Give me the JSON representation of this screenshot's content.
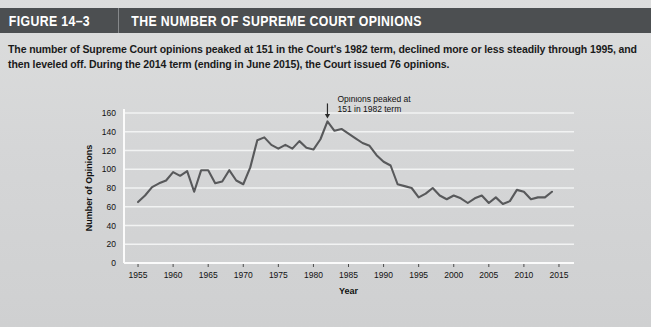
{
  "header": {
    "figure_number": "FIGURE 14–3",
    "title": "THE NUMBER OF SUPREME COURT OPINIONS",
    "bar_color": "#4c4f51",
    "text_color": "#ffffff"
  },
  "caption": "The number of Supreme Court opinions peaked at 151 in the Court's 1982 term, declined more or less steadily through 1995, and then leveled off. During the 2014 term (ending in June 2015), the Court issued 76 opinions.",
  "chart_data": {
    "type": "line",
    "title": "",
    "xlabel": "Year",
    "ylabel": "Number of Opinions",
    "xlim": [
      1953,
      2017
    ],
    "ylim": [
      0,
      160
    ],
    "xticks": [
      "1955",
      "1960",
      "1965",
      "1970",
      "1975",
      "1980",
      "1985",
      "1990",
      "1995",
      "2000",
      "2005",
      "2010",
      "2015"
    ],
    "yticks": [
      "0",
      "20",
      "40",
      "60",
      "80",
      "100",
      "120",
      "140",
      "160"
    ],
    "grid": true,
    "legend": null,
    "line_color": "#58595b",
    "grid_color": "#f2f3f3",
    "plot_background": "#d6d7d8",
    "annotations": [
      {
        "text_line1": "Opinions peaked at",
        "text_line2": "151 in 1982 term",
        "points_to_year": 1982,
        "points_to_value": 151,
        "marker": "down-arrow"
      }
    ],
    "x": [
      1955,
      1956,
      1957,
      1958,
      1959,
      1960,
      1961,
      1962,
      1963,
      1964,
      1965,
      1966,
      1967,
      1968,
      1969,
      1970,
      1971,
      1972,
      1973,
      1974,
      1975,
      1976,
      1977,
      1978,
      1979,
      1980,
      1981,
      1982,
      1983,
      1984,
      1985,
      1986,
      1987,
      1988,
      1989,
      1990,
      1991,
      1992,
      1993,
      1994,
      1995,
      1996,
      1997,
      1998,
      1999,
      2000,
      2001,
      2002,
      2003,
      2004,
      2005,
      2006,
      2007,
      2008,
      2009,
      2010,
      2011,
      2012,
      2013,
      2014
    ],
    "y": [
      65,
      72,
      81,
      85,
      88,
      97,
      93,
      98,
      76,
      99,
      99,
      85,
      87,
      99,
      88,
      84,
      102,
      131,
      134,
      126,
      122,
      126,
      122,
      130,
      123,
      121,
      132,
      151,
      141,
      143,
      138,
      133,
      128,
      125,
      115,
      108,
      104,
      84,
      82,
      80,
      70,
      74,
      80,
      72,
      68,
      72,
      69,
      64,
      69,
      72,
      64,
      70,
      63,
      66,
      78,
      76,
      68,
      70,
      70,
      76
    ],
    "series_name": "Supreme Court opinions"
  },
  "page_background": "#d8d9da"
}
